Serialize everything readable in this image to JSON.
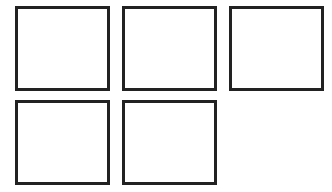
{
  "diagram": {
    "layout": "grid",
    "columns": 3,
    "rows": 2,
    "box_count": 5,
    "stroke_color": "#222222",
    "fill_color": "#ffffff",
    "boxes": [
      {
        "row": 1,
        "col": 1,
        "label": ""
      },
      {
        "row": 1,
        "col": 2,
        "label": ""
      },
      {
        "row": 1,
        "col": 3,
        "label": ""
      },
      {
        "row": 2,
        "col": 1,
        "label": ""
      },
      {
        "row": 2,
        "col": 2,
        "label": ""
      }
    ]
  }
}
